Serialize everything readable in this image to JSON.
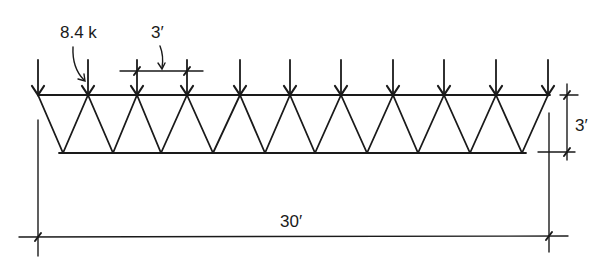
{
  "diagram": {
    "type": "truss",
    "colors": {
      "line": "#1a1a1a",
      "background": "#ffffff"
    },
    "labels": {
      "load": "8.4 k",
      "panel_spacing": "3′",
      "depth": "3′",
      "span": "30′"
    },
    "geometry": {
      "top_chord_y": 95,
      "bottom_chord_y": 153,
      "top_nodes_x": [
        38,
        88,
        137,
        187,
        240,
        290,
        341,
        393,
        444,
        496,
        548
      ],
      "bottom_nodes_x": [
        63,
        113,
        161,
        213,
        265,
        315,
        367,
        418,
        470,
        522
      ],
      "load_arrow_top_y": 60,
      "load_count": 11
    }
  }
}
